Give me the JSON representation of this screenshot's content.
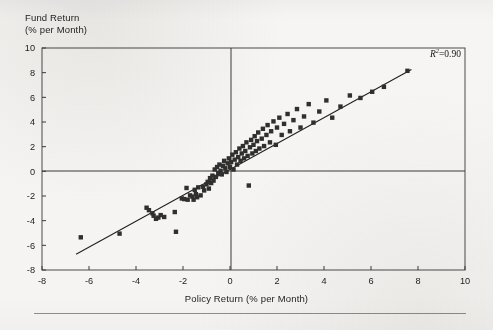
{
  "figure": {
    "background_color": "#f5f4f2",
    "ink_color": "#262626",
    "marker_color": "#2f2f2f",
    "frame_color": "#4a4a4a"
  },
  "annotations": {
    "r2_symbol": "R",
    "r2_exponent": "2",
    "r2_value": "=0.90"
  },
  "chart_data": {
    "type": "scatter",
    "title": "",
    "xlabel": "Policy Return (% per Month)",
    "ylabel": "Fund Return\n(% per Month)",
    "ylabel_line1": "Fund Return",
    "ylabel_line2": "(% per Month)",
    "xlim": [
      -8,
      10
    ],
    "ylim": [
      -8,
      10
    ],
    "xticks": [
      -8,
      -6,
      -4,
      -2,
      0,
      2,
      4,
      6,
      8,
      10
    ],
    "yticks": [
      -8,
      -6,
      -4,
      -2,
      0,
      2,
      4,
      6,
      8,
      10
    ],
    "xticklabels": [
      "-8",
      "-6",
      "-4",
      "-2",
      "0",
      "2",
      "4",
      "6",
      "8",
      "10"
    ],
    "yticklabels": [
      "-8",
      "-6",
      "-4",
      "-2",
      "0",
      "2",
      "4",
      "6",
      "8",
      "10"
    ],
    "grid": false,
    "legend": null,
    "zero_lines": true,
    "r_squared": 0.9,
    "marker": "square",
    "marker_size_px": 4.4,
    "trendline": {
      "type": "linear",
      "x_start": -6.55,
      "y_start": -6.72,
      "x_end": 7.72,
      "y_end": 8.25,
      "slope": 1.05,
      "intercept": 0.16
    },
    "series": [
      {
        "name": "Funds",
        "points": [
          [
            -6.35,
            -5.35
          ],
          [
            -4.7,
            -5.05
          ],
          [
            -3.55,
            -2.95
          ],
          [
            -3.45,
            -3.15
          ],
          [
            -3.3,
            -3.4
          ],
          [
            -3.25,
            -3.6
          ],
          [
            -3.15,
            -3.85
          ],
          [
            -3.05,
            -3.75
          ],
          [
            -2.95,
            -3.55
          ],
          [
            -2.8,
            -3.7
          ],
          [
            -2.35,
            -3.3
          ],
          [
            -2.3,
            -4.9
          ],
          [
            -2.05,
            -2.2
          ],
          [
            -1.95,
            -2.25
          ],
          [
            -1.85,
            -1.35
          ],
          [
            -1.8,
            -2.3
          ],
          [
            -1.7,
            -1.95
          ],
          [
            -1.6,
            -2.05
          ],
          [
            -1.55,
            -2.3
          ],
          [
            -1.5,
            -1.5
          ],
          [
            -1.45,
            -1.85
          ],
          [
            -1.4,
            -2.1
          ],
          [
            -1.35,
            -1.3
          ],
          [
            -1.25,
            -1.95
          ],
          [
            -1.15,
            -1.25
          ],
          [
            -1.1,
            -1.55
          ],
          [
            -1.0,
            -1.05
          ],
          [
            -0.95,
            -0.85
          ],
          [
            -0.9,
            -1.4
          ],
          [
            -0.85,
            -0.55
          ],
          [
            -0.8,
            -0.95
          ],
          [
            -0.75,
            -0.35
          ],
          [
            -0.7,
            -0.75
          ],
          [
            -0.65,
            0.15
          ],
          [
            -0.6,
            -0.45
          ],
          [
            -0.55,
            0.35
          ],
          [
            -0.5,
            -0.15
          ],
          [
            -0.45,
            0.55
          ],
          [
            -0.4,
            0.05
          ],
          [
            -0.35,
            -0.25
          ],
          [
            -0.3,
            0.45
          ],
          [
            -0.25,
            0.85
          ],
          [
            -0.2,
            0.25
          ],
          [
            -0.15,
            -0.05
          ],
          [
            -0.1,
            0.65
          ],
          [
            -0.05,
            1.05
          ],
          [
            0.0,
            0.35
          ],
          [
            0.05,
            0.75
          ],
          [
            0.1,
            1.35
          ],
          [
            0.15,
            0.15
          ],
          [
            0.2,
            0.95
          ],
          [
            0.25,
            1.55
          ],
          [
            0.3,
            0.55
          ],
          [
            0.35,
            1.15
          ],
          [
            0.4,
            1.85
          ],
          [
            0.45,
            0.85
          ],
          [
            0.5,
            1.45
          ],
          [
            0.55,
            2.05
          ],
          [
            0.6,
            1.05
          ],
          [
            0.65,
            1.65
          ],
          [
            0.7,
            2.35
          ],
          [
            0.75,
            1.25
          ],
          [
            0.8,
            -1.15
          ],
          [
            0.85,
            1.95
          ],
          [
            0.9,
            2.55
          ],
          [
            0.95,
            1.45
          ],
          [
            1.0,
            2.15
          ],
          [
            1.05,
            2.85
          ],
          [
            1.1,
            1.65
          ],
          [
            1.15,
            2.45
          ],
          [
            1.2,
            3.15
          ],
          [
            1.25,
            1.85
          ],
          [
            1.35,
            2.65
          ],
          [
            1.4,
            3.45
          ],
          [
            1.45,
            2.05
          ],
          [
            1.55,
            2.95
          ],
          [
            1.6,
            3.75
          ],
          [
            1.7,
            2.35
          ],
          [
            1.75,
            3.25
          ],
          [
            1.85,
            4.05
          ],
          [
            1.95,
            2.15
          ],
          [
            2.0,
            3.55
          ],
          [
            2.1,
            4.35
          ],
          [
            2.2,
            2.95
          ],
          [
            2.3,
            3.85
          ],
          [
            2.45,
            4.65
          ],
          [
            2.55,
            3.25
          ],
          [
            2.7,
            4.15
          ],
          [
            2.85,
            5.05
          ],
          [
            3.0,
            3.55
          ],
          [
            3.15,
            4.45
          ],
          [
            3.35,
            5.45
          ],
          [
            3.55,
            3.95
          ],
          [
            3.8,
            4.85
          ],
          [
            4.1,
            5.75
          ],
          [
            4.35,
            4.35
          ],
          [
            4.7,
            5.25
          ],
          [
            5.1,
            6.15
          ],
          [
            5.55,
            5.95
          ],
          [
            6.05,
            6.45
          ],
          [
            6.55,
            6.85
          ],
          [
            7.55,
            8.15
          ]
        ]
      }
    ]
  }
}
